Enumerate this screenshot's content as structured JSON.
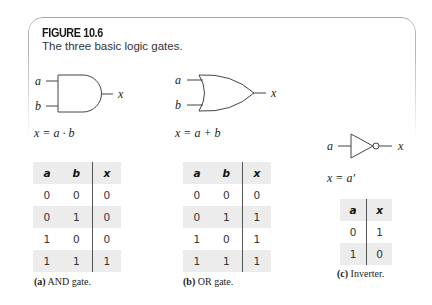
{
  "figure": {
    "label": "FIGURE 10.6",
    "subtitle": "The three basic logic gates."
  },
  "panels": [
    {
      "id": "a",
      "gate": "and-gate",
      "inputs": [
        "a",
        "b"
      ],
      "output": "x",
      "equation": "x = a · b",
      "caption_tag": "(a)",
      "caption_text": " AND gate.",
      "table": {
        "headers": [
          "a",
          "b",
          "x"
        ],
        "rows": [
          [
            "0",
            "0",
            "0"
          ],
          [
            "0",
            "1",
            "0"
          ],
          [
            "1",
            "0",
            "0"
          ],
          [
            "1",
            "1",
            "1"
          ]
        ]
      }
    },
    {
      "id": "b",
      "gate": "or-gate",
      "inputs": [
        "a",
        "b"
      ],
      "output": "x",
      "equation": "x = a + b",
      "caption_tag": "(b)",
      "caption_text": " OR gate.",
      "table": {
        "headers": [
          "a",
          "b",
          "x"
        ],
        "rows": [
          [
            "0",
            "0",
            "0"
          ],
          [
            "0",
            "1",
            "1"
          ],
          [
            "1",
            "0",
            "1"
          ],
          [
            "1",
            "1",
            "1"
          ]
        ]
      }
    },
    {
      "id": "c",
      "gate": "inverter",
      "inputs": [
        "a"
      ],
      "output": "x",
      "equation": "x = a′",
      "caption_tag": "(c)",
      "caption_text": " Inverter.",
      "table": {
        "headers": [
          "a",
          "x"
        ],
        "rows": [
          [
            "0",
            "1"
          ],
          [
            "1",
            "0"
          ]
        ]
      }
    }
  ],
  "colors": {
    "table_shade": "#ececec",
    "frame": "#b0b0b0",
    "line": "#444444"
  }
}
